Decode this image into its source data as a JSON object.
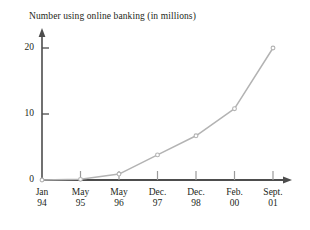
{
  "chart_data": {
    "type": "line",
    "title": "Number using online banking (in millions)",
    "xlabel": "",
    "ylabel": "",
    "categories": [
      "Jan 94",
      "May 95",
      "May 96",
      "Dec. 97",
      "Dec. 98",
      "Feb. 00",
      "Sept. 01"
    ],
    "x_tick_lines": [
      {
        "line1": "Jan",
        "line2": "94"
      },
      {
        "line1": "May",
        "line2": "95"
      },
      {
        "line1": "May",
        "line2": "96"
      },
      {
        "line1": "Dec.",
        "line2": "97"
      },
      {
        "line1": "Dec.",
        "line2": "98"
      },
      {
        "line1": "Feb.",
        "line2": "00"
      },
      {
        "line1": "Sept.",
        "line2": "01"
      }
    ],
    "values": [
      0,
      0.1,
      0.9,
      3.8,
      6.7,
      10.8,
      20
    ],
    "y_ticks": [
      0,
      10,
      20
    ],
    "y_tick_labels": [
      "0",
      "10",
      "20"
    ],
    "ylim": [
      0,
      23
    ],
    "grid": false,
    "legend": false,
    "series_color": "#b3b3b3",
    "axis_color": "#4d4d4d",
    "marker": "circle"
  },
  "axes": {
    "y_axis_name": "value-axis",
    "x_axis_name": "category-axis",
    "y_arrow": "up-arrow",
    "x_arrow": "right-arrow"
  }
}
